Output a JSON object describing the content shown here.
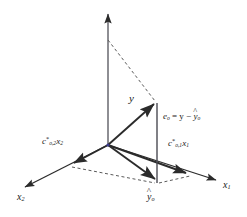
{
  "figure": {
    "background_color": "#ffffff",
    "line_color": "#2b2b2b",
    "accent_color": "#3a3a8c"
  },
  "labels": {
    "vertical_axis": "",
    "axis_x1": "x",
    "axis_x1_sub": "1",
    "axis_x2": "x",
    "axis_x2_sub": "2",
    "vector_y": "y",
    "projection": "y",
    "projection_sub": "o",
    "projection_hat": "^",
    "error_lhs": "e",
    "error_lhs_sub": "o",
    "error_eq": " = y − ",
    "error_rhs": "y",
    "error_rhs_sub": "o",
    "error_rhs_hat": "^",
    "component_1_c": "c",
    "component_1_star": "*",
    "component_1_sub": "o,1",
    "component_1_x": "x",
    "component_1_xsub": "1",
    "component_2_c": "c",
    "component_2_star": "*",
    "component_2_sub": "o,2",
    "component_2_x": "x",
    "component_2_xsub": "2"
  },
  "geometry": {
    "origin_x": 108,
    "origin_y": 145,
    "vertical_axis_tip_x": 108,
    "vertical_axis_tip_y": 8,
    "y_tip_x": 157,
    "y_tip_y": 99,
    "yhat_tip_x": 157,
    "yhat_tip_y": 183,
    "c1_tip_x": 190,
    "c1_tip_y": 175,
    "c2_tip_x": 70,
    "c2_tip_y": 165,
    "x1_axis_end_x": 219,
    "x1_axis_end_y": 181,
    "x2_axis_end_x": 21,
    "x2_axis_end_y": 189,
    "dashed_top_x": 108,
    "dashed_top_y": 40
  }
}
